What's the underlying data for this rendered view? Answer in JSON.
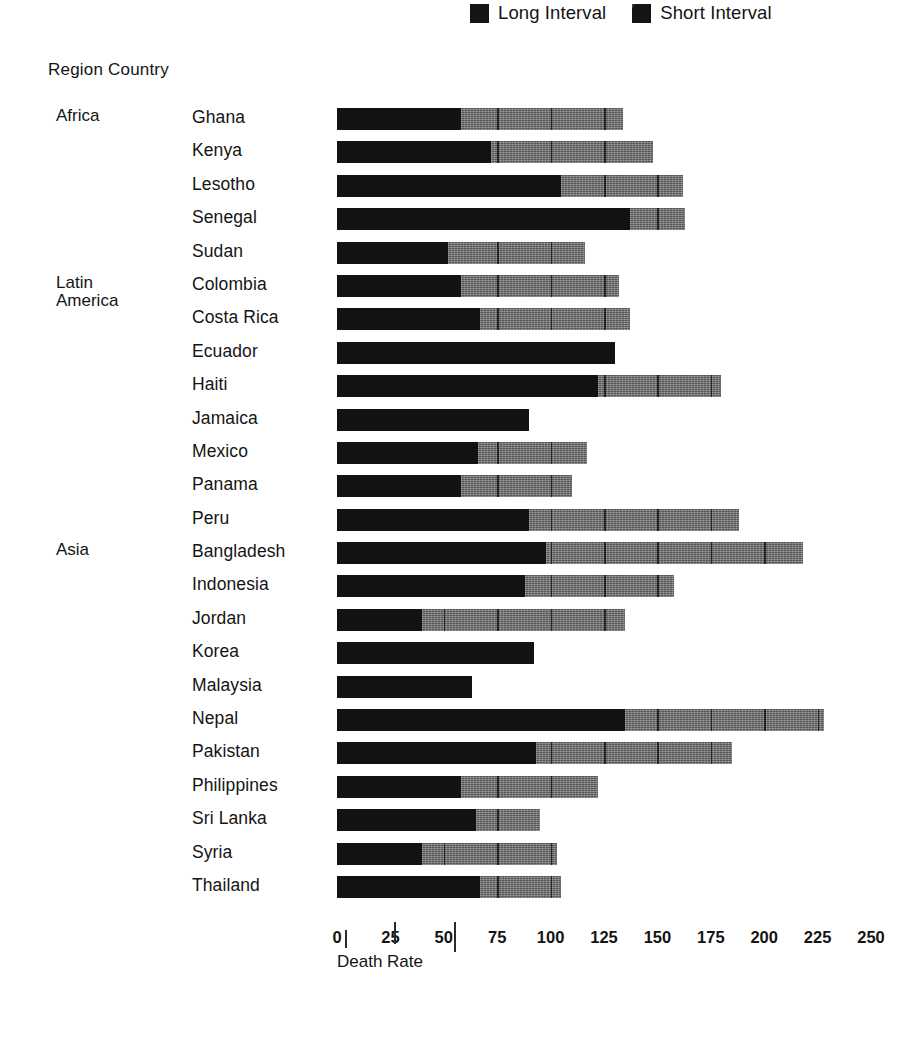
{
  "legend": {
    "entries": [
      {
        "label": "Long Interval",
        "style": "long",
        "color": "#141414"
      },
      {
        "label": "Short Interval",
        "style": "short",
        "color": "#141414"
      }
    ]
  },
  "table_header": "Region Country",
  "axis": {
    "title": "Death Rate",
    "ticks": [
      0,
      25,
      50,
      75,
      100,
      125,
      150,
      175,
      200,
      225,
      250
    ],
    "min": 0,
    "max": 250
  },
  "chart_data": {
    "type": "bar",
    "orientation": "horizontal",
    "stacked": true,
    "title": "",
    "xlabel": "Death Rate",
    "ylabel": "Region Country",
    "xlim": [
      0,
      250
    ],
    "grid": false,
    "legend_position": "top-right",
    "series": [
      {
        "name": "Long Interval",
        "color": "#121212"
      },
      {
        "name": "Short Interval",
        "color": "#6e6e6e"
      }
    ],
    "categories": [
      "Ghana",
      "Kenya",
      "Lesotho",
      "Senegal",
      "Sudan",
      "Colombia",
      "Costa Rica",
      "Ecuador",
      "Haiti",
      "Jamaica",
      "Mexico",
      "Panama",
      "Peru",
      "Bangladesh",
      "Indonesia",
      "Jordan",
      "Korea",
      "Malaysia",
      "Nepal",
      "Pakistan",
      "Philippines",
      "Sri Lanka",
      "Syria",
      "Thailand"
    ],
    "rows": [
      {
        "region": "Africa",
        "country": "Ghana",
        "long": 58,
        "short": 76,
        "total": 134
      },
      {
        "region": "",
        "country": "Kenya",
        "long": 72,
        "short": 76,
        "total": 148
      },
      {
        "region": "",
        "country": "Lesotho",
        "long": 105,
        "short": 57,
        "total": 162
      },
      {
        "region": "",
        "country": "Senegal",
        "long": 137,
        "short": 26,
        "total": 163
      },
      {
        "region": "",
        "country": "Sudan",
        "long": 52,
        "short": 64,
        "total": 116
      },
      {
        "region": "Latin\nAmerica",
        "country": "Colombia",
        "long": 58,
        "short": 74,
        "total": 132
      },
      {
        "region": "",
        "country": "Costa Rica",
        "long": 67,
        "short": 70,
        "total": 137
      },
      {
        "region": "",
        "country": "Ecuador",
        "long": 130,
        "short": 0,
        "total": 130
      },
      {
        "region": "",
        "country": "Haiti",
        "long": 122,
        "short": 58,
        "total": 180
      },
      {
        "region": "",
        "country": "Jamaica",
        "long": 90,
        "short": 0,
        "total": 90
      },
      {
        "region": "",
        "country": "Mexico",
        "long": 66,
        "short": 51,
        "total": 117
      },
      {
        "region": "",
        "country": "Panama",
        "long": 58,
        "short": 52,
        "total": 110
      },
      {
        "region": "",
        "country": "Peru",
        "long": 90,
        "short": 98,
        "total": 188
      },
      {
        "region": "Asia",
        "country": "Bangladesh",
        "long": 98,
        "short": 120,
        "total": 218
      },
      {
        "region": "",
        "country": "Indonesia",
        "long": 88,
        "short": 70,
        "total": 158
      },
      {
        "region": "",
        "country": "Jordan",
        "long": 40,
        "short": 95,
        "total": 135
      },
      {
        "region": "",
        "country": "Korea",
        "long": 92,
        "short": 0,
        "total": 92
      },
      {
        "region": "",
        "country": "Malaysia",
        "long": 63,
        "short": 0,
        "total": 63
      },
      {
        "region": "",
        "country": "Nepal",
        "long": 135,
        "short": 93,
        "total": 228
      },
      {
        "region": "",
        "country": "Pakistan",
        "long": 93,
        "short": 92,
        "total": 185
      },
      {
        "region": "",
        "country": "Philippines",
        "long": 58,
        "short": 64,
        "total": 122
      },
      {
        "region": "",
        "country": "Sri Lanka",
        "long": 65,
        "short": 30,
        "total": 95
      },
      {
        "region": "",
        "country": "Syria",
        "long": 40,
        "short": 63,
        "total": 103
      },
      {
        "region": "",
        "country": "Thailand",
        "long": 67,
        "short": 38,
        "total": 105
      }
    ]
  }
}
